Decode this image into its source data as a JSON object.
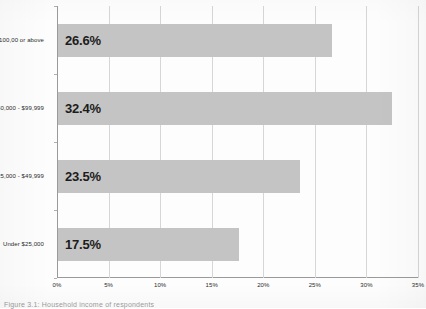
{
  "chart_data": {
    "type": "bar",
    "orientation": "horizontal",
    "title": "",
    "xlabel": "",
    "ylabel": "",
    "categories": [
      "$100,00 or above",
      "$50,000 - $99,999",
      "$25,000 - $49,999",
      "Under $25,000"
    ],
    "values": [
      26.6,
      32.4,
      23.5,
      17.5
    ],
    "value_labels": [
      "26.6%",
      "32.4%",
      "23.5%",
      "17.5%"
    ],
    "xlim": [
      0,
      35
    ],
    "xticks": [
      0,
      5,
      10,
      15,
      20,
      25,
      30,
      35
    ],
    "xtick_labels": [
      "0%",
      "5%",
      "10%",
      "15%",
      "20%",
      "25%",
      "30%",
      "35%"
    ],
    "grid": true,
    "legend": null,
    "bar_color": "#c4c4c4",
    "gridline_color": "#d6d6d6",
    "axis_color": "#9a9a9a",
    "text_color": "#1c1c1c"
  },
  "caption": {
    "prefix": "Figure",
    "text": "Figure 3.1:  Household income of respondents"
  }
}
